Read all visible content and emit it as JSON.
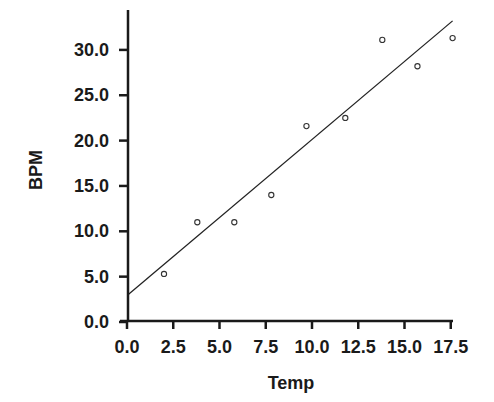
{
  "chart_data": {
    "type": "scatter",
    "title": "",
    "xlabel": "Temp",
    "ylabel": "BPM",
    "xlim": [
      0,
      17.5
    ],
    "ylim": [
      0,
      30
    ],
    "grid": false,
    "legend": null,
    "x_ticks": [
      "0.0",
      "2.5",
      "5.0",
      "7.5",
      "10.0",
      "12.5",
      "15.0",
      "17.5"
    ],
    "y_ticks": [
      "0.0",
      "5.0",
      "10.0",
      "15.0",
      "20.0",
      "25.0",
      "30.0"
    ],
    "series": [
      {
        "name": "observations",
        "marker": "open-circle",
        "x": [
          2.0,
          3.8,
          5.8,
          7.8,
          9.7,
          11.8,
          13.8,
          15.7,
          17.6
        ],
        "y": [
          5.3,
          11.0,
          11.0,
          14.0,
          21.6,
          22.5,
          31.1,
          28.2,
          31.3
        ]
      }
    ],
    "fit_line": {
      "type": "linear",
      "x_start": 0.0,
      "y_start": 3.0,
      "x_end": 17.6,
      "y_end": 33.2
    }
  }
}
